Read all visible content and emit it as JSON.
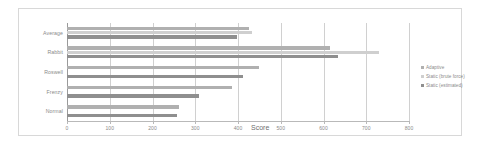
{
  "chart_data": {
    "type": "bar",
    "orientation": "horizontal",
    "title": "",
    "xlabel": "Score",
    "ylabel": "",
    "xlim": [
      0,
      800
    ],
    "xticks": [
      0,
      100,
      200,
      300,
      400,
      500,
      600,
      700,
      800
    ],
    "xtick_labels": [
      "0",
      "100",
      "200",
      "300",
      "400",
      "500",
      "600",
      "700",
      "800"
    ],
    "grid": true,
    "legend_position": "right",
    "categories": [
      "Average",
      "Rabbit",
      "Roswell",
      "Frenzy",
      "Normal"
    ],
    "series": [
      {
        "name": "Adaptive",
        "color": "#b0b0b0",
        "values": [
          425,
          615,
          450,
          385,
          262
        ]
      },
      {
        "name": "Static (brute force)",
        "color": "#cfcfcf",
        "values": [
          432,
          730,
          0,
          0,
          0
        ]
      },
      {
        "name": "Static (estimated)",
        "color": "#8f8f8f",
        "values": [
          398,
          635,
          412,
          308,
          258
        ]
      }
    ]
  },
  "axis": {
    "x_title": "Score"
  },
  "legend": {
    "entries": [
      {
        "label": "Adaptive",
        "color": "#b0b0b0"
      },
      {
        "label": "Static (brute force)",
        "color": "#cfcfcf"
      },
      {
        "label": "Static (estimated)",
        "color": "#8f8f8f"
      }
    ]
  },
  "colors": {
    "frame": "#d8d8d8",
    "gridline": "#d0d0d0",
    "axis": "#b9b9b9",
    "text": "#8a8a8a",
    "background": "#ffffff"
  }
}
